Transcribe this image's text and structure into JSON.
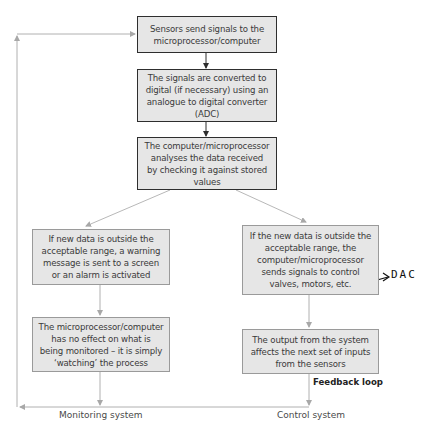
{
  "diagram": {
    "steps": [
      {
        "id": "sensors",
        "text": "Sensors send signals to the\nmicroprocessor/computer"
      },
      {
        "id": "convert",
        "text": "The signals are converted to\ndigital (if necessary) using an\nanalogue to digital converter\n(ADC)"
      },
      {
        "id": "analyse",
        "text": "The computer/microprocessor\nanalyses the data received\nby checking it against stored\nvalues"
      }
    ],
    "monitoring": {
      "label": "Monitoring system",
      "steps": [
        {
          "id": "warning",
          "text": "If new data is outside the\nacceptable range, a warning\nmessage is sent to a screen\nor an alarm is activated"
        },
        {
          "id": "no-effect",
          "text": "The microprocessor/computer\nhas no effect on what is\nbeing monitored – it is simply\n‘watching’ the process"
        }
      ]
    },
    "control": {
      "label": "Control system",
      "steps": [
        {
          "id": "send-signals",
          "text": "If the new data is outside the\nacceptable range, the\ncomputer/microprocessor\nsends signals to control\nvalves, motors, etc."
        },
        {
          "id": "output",
          "text": "The output from the system\naffects the next set of inputs\nfrom the sensors"
        }
      ],
      "feedback_label": "Feedback loop"
    },
    "annotation": {
      "text": "DAC",
      "arrow": "→"
    },
    "colors": {
      "box_fill": "#e6e6e6",
      "dark_border": "#2e2e2e",
      "light_border": "#9a9a9a",
      "light_line": "#b0b0b0"
    }
  }
}
